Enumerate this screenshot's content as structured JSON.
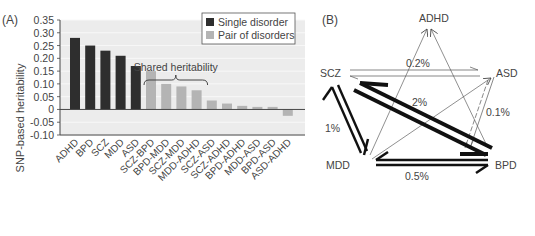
{
  "chart_data": [
    {
      "type": "bar",
      "panel_label": "(A)",
      "title": "",
      "xlabel": "",
      "ylabel": "SNP-based heritability",
      "ylim": [
        -0.1,
        0.35
      ],
      "yticks": [
        -0.1,
        -0.05,
        0,
        0.05,
        0.1,
        0.15,
        0.2,
        0.25,
        0.3,
        0.35
      ],
      "ytick_labels": [
        "-0.10",
        "-0.05",
        "0",
        "0.05",
        "0.10",
        "0.15",
        "0.20",
        "0.25",
        "0.30",
        "0.35"
      ],
      "grid": true,
      "legend_position": "top-right",
      "categories": [
        "ADHD",
        "BPD",
        "SCZ",
        "MDD",
        "ASD",
        "SCZ-BPD",
        "BPD-MDD",
        "SCZ-MDD",
        "MDD-ADHD",
        "SCZ-ASD",
        "SCZ-ADHD",
        "BPD-ADHD",
        "MDD-ASD",
        "BPD-ASD",
        "ASD-ADHD"
      ],
      "values": [
        0.28,
        0.25,
        0.23,
        0.21,
        0.17,
        0.15,
        0.1,
        0.09,
        0.075,
        0.035,
        0.023,
        0.014,
        0.01,
        0.01,
        -0.025
      ],
      "groups": [
        "single",
        "single",
        "single",
        "single",
        "single",
        "pair",
        "pair",
        "pair",
        "pair",
        "pair",
        "pair",
        "pair",
        "pair",
        "pair",
        "pair"
      ],
      "series": [
        {
          "name": "Single disorder",
          "key": "single",
          "color": "#2e2e2e"
        },
        {
          "name": "Pair of disorders",
          "key": "pair",
          "color": "#b4b4b4"
        }
      ],
      "annotations": [
        {
          "text": "Shared heritability",
          "type": "brace",
          "from_category": "SCZ-BPD",
          "to_category": "MDD-ADHD"
        }
      ],
      "colors": {
        "plot_background": "#ececec",
        "gridline": "#f8f8f8",
        "axis": "#444444"
      }
    },
    {
      "type": "diagram",
      "panel_label": "(B)",
      "nodes": [
        "ADHD",
        "ASD",
        "BPD",
        "MDD",
        "SCZ"
      ],
      "edges": [
        {
          "from": "SCZ",
          "to": "BPD",
          "label": "2%",
          "weight": "heavy",
          "style": "double-arrow"
        },
        {
          "from": "SCZ",
          "to": "MDD",
          "label": "1%",
          "weight": "medium",
          "style": "double-arrow"
        },
        {
          "from": "MDD",
          "to": "BPD",
          "label": "0.5%",
          "weight": "medium",
          "style": "double-arrow"
        },
        {
          "from": "SCZ",
          "to": "ASD",
          "label": "0.2%",
          "weight": "light",
          "style": "double-arrow"
        },
        {
          "from": "ASD",
          "to": "BPD",
          "label": "0.1%",
          "weight": "light",
          "style": "double-arrow-dashed"
        },
        {
          "from": "MDD",
          "to": "ADHD",
          "label": "",
          "weight": "thin",
          "style": "arrow"
        },
        {
          "from": "BPD",
          "to": "ADHD",
          "label": "",
          "weight": "thin",
          "style": "arrow"
        },
        {
          "from": "MDD",
          "to": "ASD",
          "label": "",
          "weight": "thin",
          "style": "arrow"
        }
      ]
    }
  ]
}
